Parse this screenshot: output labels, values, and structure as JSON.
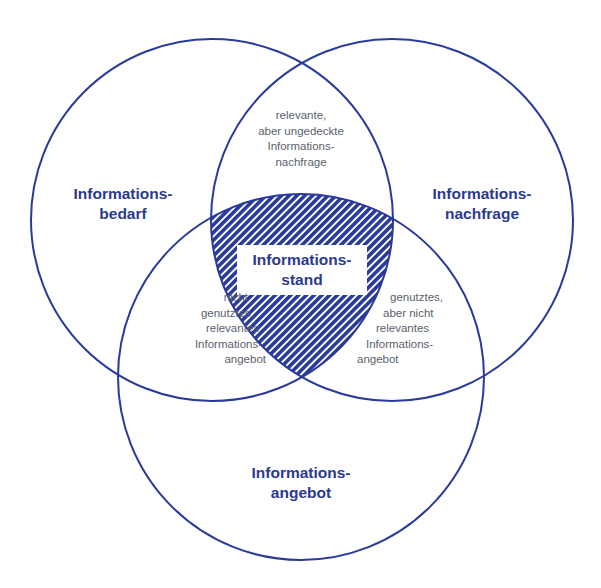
{
  "diagram": {
    "colors": {
      "stroke": "#2a3a9a",
      "hatch": "#2a3a9a",
      "label_bold": "#2b3a8f",
      "label_small": "#5a5f6e"
    },
    "circles": [
      {
        "id": "bedarf",
        "label_lines": [
          "Informations-",
          "bedarf"
        ]
      },
      {
        "id": "nachfrage",
        "label_lines": [
          "Informations-",
          "nachfrage"
        ]
      },
      {
        "id": "angebot",
        "label_lines": [
          "Informations-",
          "angebot"
        ]
      }
    ],
    "intersections": {
      "bedarf_nachfrage": [
        "relevante,",
        "aber ungedeckte",
        "Informations-",
        "nachfrage"
      ],
      "bedarf_angebot": [
        "nicht",
        "genutztes,",
        "relevantes",
        "Informations-",
        "angebot"
      ],
      "nachfrage_angebot": [
        "genutztes,",
        "aber nicht",
        "relevantes",
        "Informations-",
        "angebot"
      ],
      "center": [
        "Informations-",
        "stand"
      ]
    }
  }
}
